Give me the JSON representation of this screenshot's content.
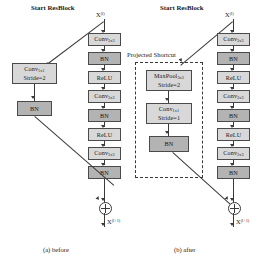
{
  "figure": {
    "title_a": "(a) before",
    "title_b": "(b) after"
  },
  "panel_a": {
    "start_label": "Start ResBlock",
    "input_label": "X",
    "input_sup": "(l)",
    "output_label": "X",
    "output_sup": "(l+1)",
    "caption": "(a) before",
    "main_path": [
      {
        "name": "conv1",
        "line1": "Conv",
        "sub1": "3x3",
        "line2": "",
        "style": "light"
      },
      {
        "name": "bn1",
        "line1": "BN",
        "sub1": "",
        "line2": "",
        "style": "dark"
      },
      {
        "name": "relu1",
        "line1": "ReLU",
        "sub1": "",
        "line2": "",
        "style": "light"
      },
      {
        "name": "conv2",
        "line1": "Conv",
        "sub1": "3x3",
        "line2": "",
        "style": "light"
      },
      {
        "name": "bn2",
        "line1": "BN",
        "sub1": "",
        "line2": "",
        "style": "dark"
      },
      {
        "name": "relu2",
        "line1": "ReLU",
        "sub1": "",
        "line2": "",
        "style": "light"
      },
      {
        "name": "conv3",
        "line1": "Conv",
        "sub1": "3x3",
        "line2": "",
        "style": "light"
      },
      {
        "name": "bn3",
        "line1": "BN",
        "sub1": "",
        "line2": "",
        "style": "dark"
      }
    ],
    "shortcut_path": [
      {
        "name": "shortcut-conv",
        "line1": "Conv",
        "sub1": "1x1",
        "line2": "Stride=2",
        "style": "light"
      },
      {
        "name": "shortcut-bn",
        "line1": "BN",
        "sub1": "",
        "line2": "",
        "style": "dark"
      }
    ],
    "merge_op": "+"
  },
  "panel_b": {
    "start_label": "Start ResBlock",
    "input_label": "X",
    "input_sup": "(l)",
    "output_label": "X",
    "output_sup": "(l+1)",
    "caption": "(b) after",
    "projected_shortcut_label": "Projected Shortcut",
    "main_path": [
      {
        "name": "conv1",
        "line1": "Conv",
        "sub1": "3x3",
        "line2": "",
        "style": "light"
      },
      {
        "name": "bn1",
        "line1": "BN",
        "sub1": "",
        "line2": "",
        "style": "dark"
      },
      {
        "name": "relu1",
        "line1": "ReLU",
        "sub1": "",
        "line2": "",
        "style": "light"
      },
      {
        "name": "conv2",
        "line1": "Conv",
        "sub1": "3x3",
        "line2": "",
        "style": "light"
      },
      {
        "name": "bn2",
        "line1": "BN",
        "sub1": "",
        "line2": "",
        "style": "dark"
      },
      {
        "name": "relu2",
        "line1": "ReLU",
        "sub1": "",
        "line2": "",
        "style": "light"
      },
      {
        "name": "conv3",
        "line1": "Conv",
        "sub1": "3x3",
        "line2": "",
        "style": "light"
      },
      {
        "name": "bn3",
        "line1": "BN",
        "sub1": "",
        "line2": "",
        "style": "dark"
      }
    ],
    "shortcut_path": [
      {
        "name": "shortcut-maxpool",
        "line1": "MaxPool",
        "sub1": "3x3",
        "line2": "Stride=2",
        "style": "light"
      },
      {
        "name": "shortcut-conv",
        "line1": "Conv",
        "sub1": "1x1",
        "line2": "Stride=1",
        "style": "light"
      },
      {
        "name": "shortcut-bn",
        "line1": "BN",
        "sub1": "",
        "line2": "",
        "style": "dark"
      }
    ],
    "merge_op": "+"
  },
  "colors": {
    "box_light": "#d8d8d8",
    "box_dark": "#b3b3b3",
    "stroke": "#3a3a3a",
    "background": "#ffffff"
  }
}
